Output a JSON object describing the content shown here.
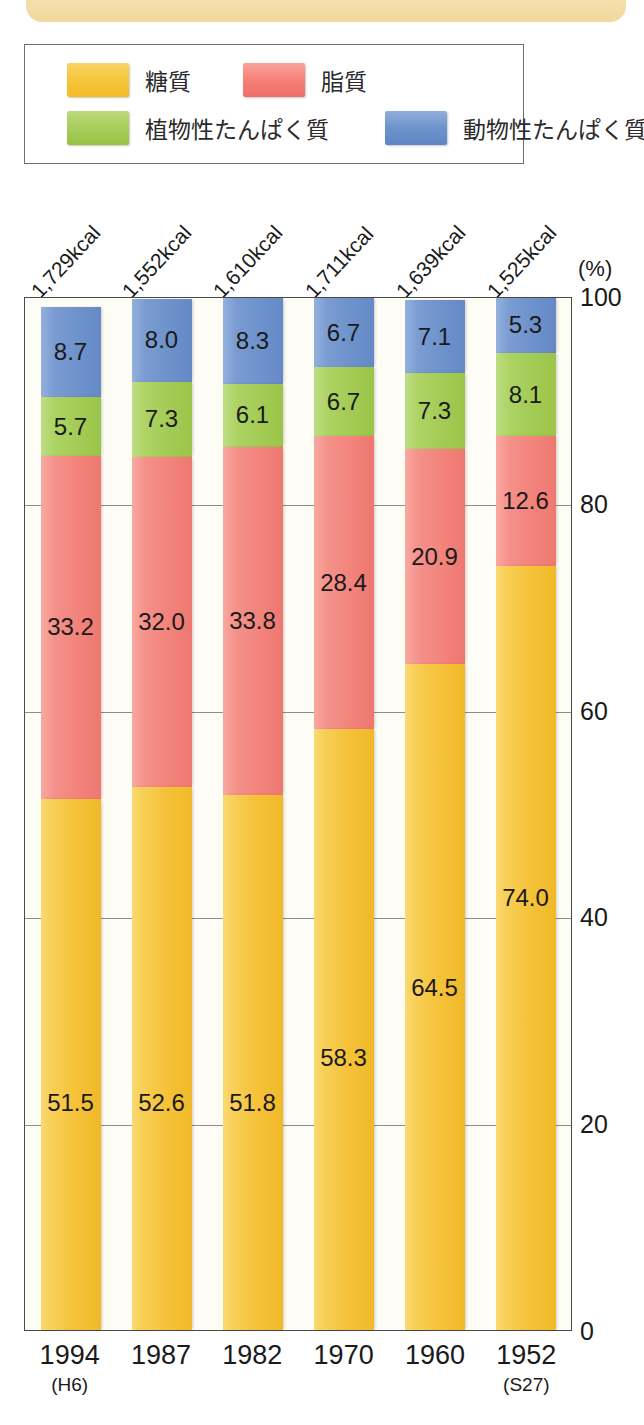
{
  "banner": {
    "name": "decorative-banner"
  },
  "legend": {
    "items": [
      {
        "label": "糖質",
        "color": "#F5C23A",
        "key": "carb"
      },
      {
        "label": "脂質",
        "color": "#F2847C",
        "key": "fat"
      },
      {
        "label": "植物性たんぱく質",
        "color": "#A4CB55",
        "key": "plant"
      },
      {
        "label": "動物性たんぱく質",
        "color": "#6E92CB",
        "key": "animal"
      }
    ]
  },
  "axis": {
    "unit": "(%)",
    "yticks": [
      "100",
      "80",
      "60",
      "40",
      "20",
      "0"
    ]
  },
  "chart_data": {
    "type": "bar",
    "title": "",
    "xlabel": "",
    "ylabel": "(%)",
    "ylim": [
      0,
      100
    ],
    "grid": true,
    "stacked": true,
    "legend_position": "top",
    "categories": [
      "1994",
      "1987",
      "1982",
      "1970",
      "1960",
      "1952"
    ],
    "category_sublabels": [
      "(H6)",
      "",
      "",
      "",
      "",
      "(S27)"
    ],
    "annotations": {
      "label": "kcal",
      "values": [
        "1,729kcal",
        "1,552kcal",
        "1,610kcal",
        "1,711kcal",
        "1,639kcal",
        "1,525kcal"
      ]
    },
    "series": [
      {
        "name": "糖質",
        "key": "carb",
        "color": "#F5C23A",
        "values": [
          51.5,
          52.6,
          51.8,
          58.3,
          64.5,
          74.0
        ]
      },
      {
        "name": "脂質",
        "key": "fat",
        "color": "#F2847C",
        "values": [
          33.2,
          32.0,
          33.8,
          28.4,
          20.9,
          12.6
        ]
      },
      {
        "name": "植物性たんぱく質",
        "key": "plant",
        "color": "#A4CB55",
        "values": [
          5.7,
          7.3,
          6.1,
          6.7,
          7.3,
          8.1
        ]
      },
      {
        "name": "動物性たんぱく質",
        "key": "animal",
        "color": "#6E92CB",
        "values": [
          8.7,
          8.0,
          8.3,
          6.7,
          7.1,
          5.3
        ]
      }
    ],
    "value_labels": [
      {
        "category": "1994",
        "carb": "51.5",
        "fat": "33.2",
        "plant": "5.7",
        "animal": "8.7"
      },
      {
        "category": "1987",
        "carb": "52.6",
        "fat": "32.0",
        "plant": "7.3",
        "animal": "8.0"
      },
      {
        "category": "1982",
        "carb": "51.8",
        "fat": "33.8",
        "plant": "6.1",
        "animal": "8.3"
      },
      {
        "category": "1970",
        "carb": "58.3",
        "fat": "28.4",
        "plant": "6.7",
        "animal": "6.7"
      },
      {
        "category": "1960",
        "carb": "64.5",
        "fat": "20.9",
        "plant": "7.3",
        "animal": "7.1"
      },
      {
        "category": "1952",
        "carb": "74.0",
        "fat": "12.6",
        "plant": "8.1",
        "animal": "5.3"
      }
    ]
  }
}
